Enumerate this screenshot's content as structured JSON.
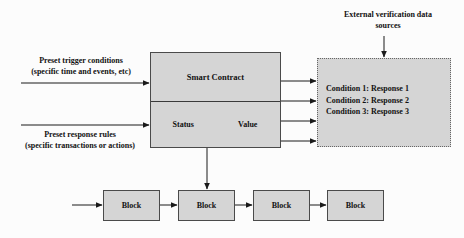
{
  "figure": {
    "type": "flow-diagram"
  },
  "nodes": {
    "smart_contract": {
      "title": "Smart Contract",
      "status_label": "Status",
      "value_label": "Value"
    },
    "conditions": {
      "items": [
        "Condition 1: Response 1",
        "Condition 2: Response 2",
        "Condition 3: Response 3"
      ]
    },
    "blocks": [
      {
        "label": "Block"
      },
      {
        "label": "Block"
      },
      {
        "label": "Block"
      },
      {
        "label": "Block"
      }
    ]
  },
  "labels": {
    "external_sources_line1": "External verification data",
    "external_sources_line2": "sources",
    "trigger_line1": "Preset trigger conditions",
    "trigger_line2": "(specific time and events, etc)",
    "response_line1": "Preset response rules",
    "response_line2": "(specific transactions or actions)"
  },
  "style": {
    "node_fill": "#d5d5d5",
    "node_stroke": "#4a4a4a",
    "dashed_stroke": "#666666",
    "arrow_color": "#1a1a1a",
    "page_background": "#fcfcfc",
    "text_color": "#111111"
  }
}
